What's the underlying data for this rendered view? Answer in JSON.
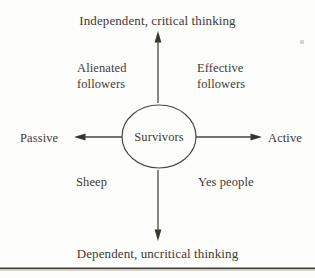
{
  "diagram": {
    "title_top": "Independent, critical thinking",
    "title_bottom": "Dependent, uncritical thinking",
    "axis_left_label": "Passive",
    "axis_right_label": "Active",
    "center_label": "Survivors",
    "quadrants": {
      "top_left": "Alienated\nfollowers",
      "top_right": "Effective\nfollowers",
      "bottom_left": "Sheep",
      "bottom_right": "Yes people"
    },
    "colors": {
      "ink": "#3e3a35",
      "line": "#4a463f",
      "background": "#fdfdfc"
    }
  }
}
